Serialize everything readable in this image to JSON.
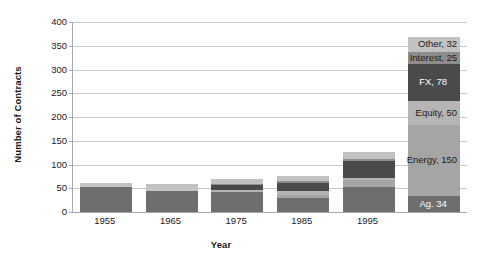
{
  "chart_data": {
    "type": "bar",
    "subtype": "stacked-bar",
    "title": "",
    "xlabel": "Year",
    "ylabel": "Number of Contracts",
    "ylim": [
      0,
      400
    ],
    "yticks": [
      0,
      50,
      100,
      150,
      200,
      250,
      300,
      350,
      400
    ],
    "ytick_labels": [
      "0",
      "50",
      "100",
      "150",
      "200",
      "250",
      "300",
      "350",
      "400"
    ],
    "grid": true,
    "legend": "none",
    "categories": [
      "1955",
      "1965",
      "1975",
      "1985",
      "1995",
      ""
    ],
    "series": [
      {
        "name": "Ag.",
        "color": "#6e6e6e",
        "values": [
          52,
          45,
          42,
          30,
          52,
          34
        ]
      },
      {
        "name": "Energy",
        "color": "#a5a5a5",
        "values": [
          0,
          0,
          0,
          6,
          16,
          150
        ]
      },
      {
        "name": "Equity",
        "color": "#b5b5b5",
        "values": [
          0,
          0,
          4,
          9,
          4,
          50
        ]
      },
      {
        "name": "FX",
        "color": "#4a4a4a",
        "values": [
          0,
          0,
          12,
          16,
          35,
          78
        ]
      },
      {
        "name": "Interest",
        "color": "#8d8d8d",
        "values": [
          0,
          0,
          2,
          4,
          5,
          25
        ]
      },
      {
        "name": "Other",
        "color": "#c2c2c2",
        "values": [
          10,
          13,
          10,
          11,
          14,
          32
        ]
      }
    ],
    "bar_totals": [
      62,
      58,
      70,
      76,
      126,
      369
    ],
    "annotations": [
      {
        "text": "Other, 32",
        "value": 32,
        "series": "Other",
        "placement": "right-outside"
      },
      {
        "text": "Interest, 25",
        "value": 25,
        "series": "Interest",
        "placement": "right-outside"
      },
      {
        "text": "FX, 78",
        "value": 78,
        "series": "FX",
        "placement": "inside"
      },
      {
        "text": "Equity, 50",
        "value": 50,
        "series": "Equity",
        "placement": "right-outside"
      },
      {
        "text": "Energy, 150",
        "value": 150,
        "series": "Energy",
        "placement": "right-outside"
      },
      {
        "text": "Ag. 34",
        "value": 34,
        "series": "Ag.",
        "placement": "inside"
      }
    ]
  },
  "axes": {
    "y_title": "Number of Contracts",
    "x_title": "Year",
    "ytick_0": "0",
    "ytick_1": "50",
    "ytick_2": "100",
    "ytick_3": "150",
    "ytick_4": "200",
    "ytick_5": "250",
    "ytick_6": "300",
    "ytick_7": "350",
    "ytick_8": "400",
    "xtick_0": "1955",
    "xtick_1": "1965",
    "xtick_2": "1975",
    "xtick_3": "1985",
    "xtick_4": "1995"
  },
  "labels": {
    "other": "Other, 32",
    "interest": "Interest, 25",
    "fx": "FX, 78",
    "equity": "Equity, 50",
    "energy": "Energy, 150",
    "ag": "Ag. 34"
  }
}
